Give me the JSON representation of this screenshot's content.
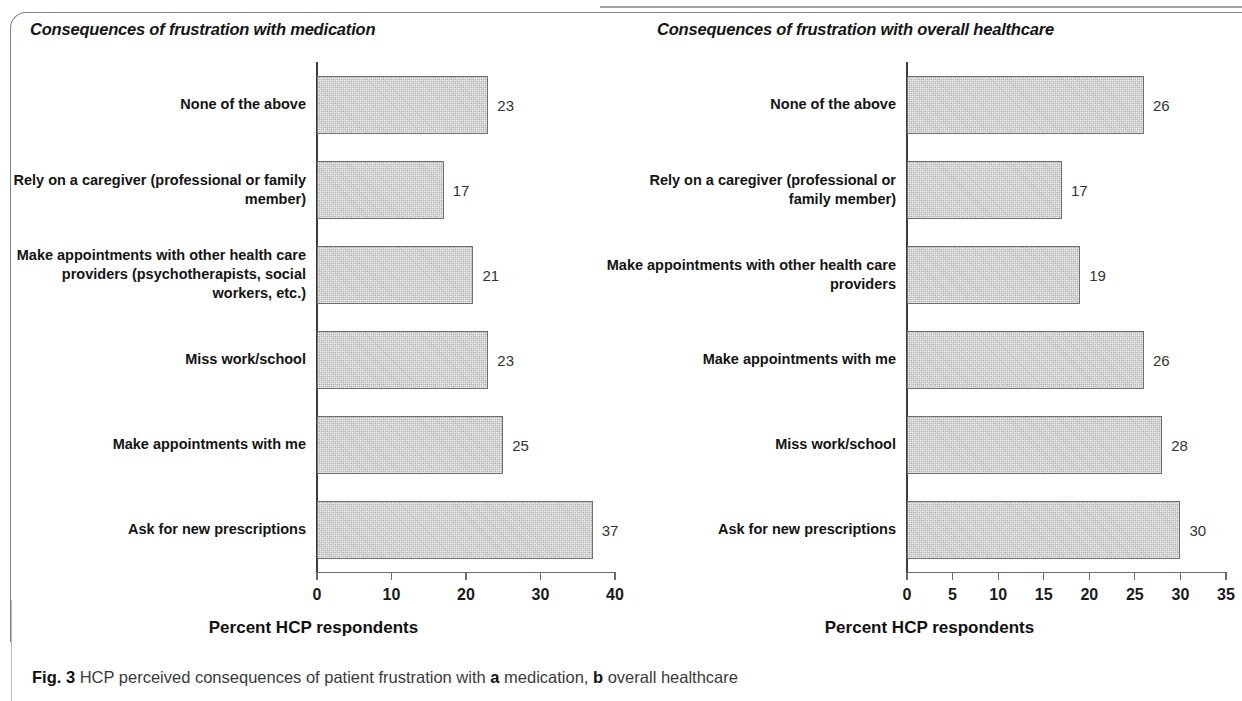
{
  "figure": {
    "caption_number": "Fig. 3",
    "caption_text_1": " HCP perceived consequences of patient frustration with ",
    "caption_label_a": "a",
    "caption_text_2": " medication, ",
    "caption_label_b": "b",
    "caption_text_3": " overall healthcare"
  },
  "chart_data": [
    {
      "type": "bar",
      "orientation": "horizontal",
      "panel": "a",
      "title": "Consequences of frustration with medication",
      "xlabel": "Percent HCP respondents",
      "ylabel": "",
      "xlim": [
        0,
        40
      ],
      "xticks": [
        0,
        10,
        20,
        30,
        40
      ],
      "xtick_labels": [
        "0",
        "10",
        "20",
        "30",
        "40"
      ],
      "grid": false,
      "legend": null,
      "bar_color": "#c9c9c9",
      "bar_edge_color": "#6e6e6e",
      "categories": [
        "None of the above",
        "Rely on a caregiver (professional or family member)",
        "Make appointments with other health care providers (psychotherapists, social workers, etc.)",
        "Miss work/school",
        "Make appointments with me",
        "Ask for new prescriptions"
      ],
      "values": [
        23,
        17,
        21,
        23,
        25,
        37
      ],
      "data_labels": [
        "23",
        "17",
        "21",
        "23",
        "25",
        "37"
      ]
    },
    {
      "type": "bar",
      "orientation": "horizontal",
      "panel": "b",
      "title": "Consequences of frustration with overall healthcare",
      "xlabel": "Percent HCP respondents",
      "ylabel": "",
      "xlim": [
        0,
        35
      ],
      "xticks": [
        0,
        5,
        10,
        15,
        20,
        25,
        30,
        35
      ],
      "xtick_labels": [
        "0",
        "5",
        "10",
        "15",
        "20",
        "25",
        "30",
        "35"
      ],
      "grid": false,
      "legend": null,
      "bar_color": "#c9c9c9",
      "bar_edge_color": "#6e6e6e",
      "categories": [
        "None of the above",
        "Rely on a caregiver (professional or family member)",
        "Make appointments with other health care providers",
        "Make appointments with me",
        "Miss work/school",
        "Ask for new prescriptions"
      ],
      "values": [
        26,
        17,
        19,
        26,
        28,
        30
      ],
      "data_labels": [
        "26",
        "17",
        "19",
        "26",
        "28",
        "30"
      ]
    }
  ]
}
